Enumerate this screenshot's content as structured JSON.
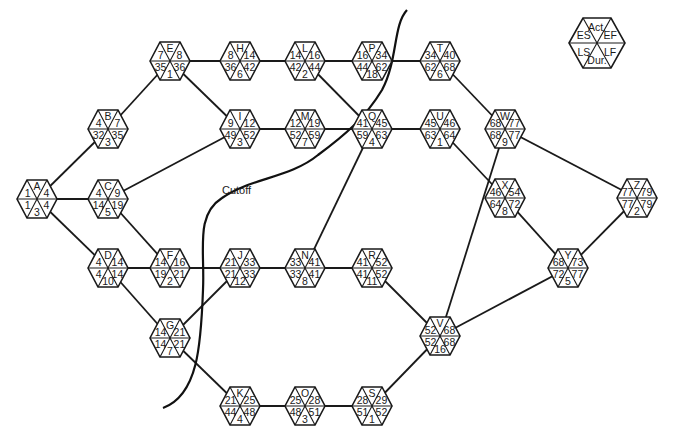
{
  "legend": {
    "center": [
      597,
      43
    ],
    "labels": {
      "act": "Act.",
      "es": "ES",
      "ef": "EF",
      "ls": "LS",
      "lf": "LF",
      "dur": "Dur."
    }
  },
  "cutoff": {
    "label": "Cutoff",
    "label_pos": [
      222,
      192
    ]
  },
  "nodes": [
    {
      "id": "A",
      "x": 37,
      "y": 199,
      "es": 1,
      "ef": 4,
      "ls": 1,
      "lf": 4,
      "dur": 3
    },
    {
      "id": "B",
      "x": 108,
      "y": 129,
      "es": 4,
      "ef": 7,
      "ls": 32,
      "lf": 35,
      "dur": 3
    },
    {
      "id": "C",
      "x": 108,
      "y": 199,
      "es": 4,
      "ef": 9,
      "ls": 14,
      "lf": 19,
      "dur": 5
    },
    {
      "id": "D",
      "x": 108,
      "y": 268,
      "es": 4,
      "ef": 14,
      "ls": 4,
      "lf": 14,
      "dur": 10
    },
    {
      "id": "E",
      "x": 170,
      "y": 61,
      "es": 7,
      "ef": 8,
      "ls": 35,
      "lf": 36,
      "dur": 1
    },
    {
      "id": "F",
      "x": 170,
      "y": 268,
      "es": 14,
      "ef": 16,
      "ls": 19,
      "lf": 21,
      "dur": 2
    },
    {
      "id": "G",
      "x": 170,
      "y": 338,
      "es": 14,
      "ef": 21,
      "ls": 14,
      "lf": 21,
      "dur": 7
    },
    {
      "id": "H",
      "x": 240,
      "y": 61,
      "es": 8,
      "ef": 14,
      "ls": 36,
      "lf": 42,
      "dur": 6
    },
    {
      "id": "I",
      "x": 240,
      "y": 129,
      "es": 9,
      "ef": 12,
      "ls": 49,
      "lf": 52,
      "dur": 3
    },
    {
      "id": "J",
      "x": 240,
      "y": 268,
      "es": 21,
      "ef": 33,
      "ls": 21,
      "lf": 33,
      "dur": 12
    },
    {
      "id": "K",
      "x": 240,
      "y": 406,
      "es": 21,
      "ef": 25,
      "ls": 44,
      "lf": 48,
      "dur": 4
    },
    {
      "id": "L",
      "x": 305,
      "y": 61,
      "es": 14,
      "ef": 16,
      "ls": 42,
      "lf": 44,
      "dur": 2
    },
    {
      "id": "M",
      "x": 305,
      "y": 129,
      "es": 12,
      "ef": 19,
      "ls": 52,
      "lf": 59,
      "dur": 7
    },
    {
      "id": "N",
      "x": 305,
      "y": 268,
      "es": 33,
      "ef": 41,
      "ls": 33,
      "lf": 41,
      "dur": 8
    },
    {
      "id": "O",
      "x": 305,
      "y": 406,
      "es": 25,
      "ef": 28,
      "ls": 48,
      "lf": 51,
      "dur": 3
    },
    {
      "id": "P",
      "x": 372,
      "y": 61,
      "es": 16,
      "ef": 34,
      "ls": 44,
      "lf": 62,
      "dur": 18
    },
    {
      "id": "Q",
      "x": 372,
      "y": 129,
      "es": 41,
      "ef": 45,
      "ls": 59,
      "lf": 63,
      "dur": 4
    },
    {
      "id": "R",
      "x": 372,
      "y": 268,
      "es": 41,
      "ef": 52,
      "ls": 41,
      "lf": 52,
      "dur": 11
    },
    {
      "id": "S",
      "x": 372,
      "y": 406,
      "es": 28,
      "ef": 29,
      "ls": 51,
      "lf": 52,
      "dur": 1
    },
    {
      "id": "T",
      "x": 440,
      "y": 61,
      "es": 34,
      "ef": 40,
      "ls": 62,
      "lf": 68,
      "dur": 6
    },
    {
      "id": "U",
      "x": 440,
      "y": 129,
      "es": 45,
      "ef": 46,
      "ls": 63,
      "lf": 64,
      "dur": 1
    },
    {
      "id": "V",
      "x": 440,
      "y": 336,
      "es": 52,
      "ef": 68,
      "ls": 52,
      "lf": 68,
      "dur": 16
    },
    {
      "id": "W",
      "x": 505,
      "y": 129,
      "es": 68,
      "ef": 77,
      "ls": 68,
      "lf": 77,
      "dur": 9
    },
    {
      "id": "X",
      "x": 505,
      "y": 198,
      "es": 46,
      "ef": 54,
      "ls": 64,
      "lf": 72,
      "dur": 8
    },
    {
      "id": "Y",
      "x": 568,
      "y": 268,
      "es": 68,
      "ef": 73,
      "ls": 72,
      "lf": 77,
      "dur": 5
    },
    {
      "id": "Z",
      "x": 637,
      "y": 198,
      "es": 77,
      "ef": 79,
      "ls": 77,
      "lf": 79,
      "dur": 2
    }
  ],
  "edges": [
    [
      "A",
      "B"
    ],
    [
      "A",
      "C"
    ],
    [
      "A",
      "D"
    ],
    [
      "B",
      "E"
    ],
    [
      "C",
      "I"
    ],
    [
      "C",
      "F"
    ],
    [
      "D",
      "F"
    ],
    [
      "D",
      "G"
    ],
    [
      "E",
      "H"
    ],
    [
      "E",
      "I"
    ],
    [
      "H",
      "L"
    ],
    [
      "I",
      "M"
    ],
    [
      "L",
      "P"
    ],
    [
      "L",
      "Q"
    ],
    [
      "M",
      "Q"
    ],
    [
      "P",
      "T"
    ],
    [
      "Q",
      "U"
    ],
    [
      "F",
      "J"
    ],
    [
      "G",
      "J"
    ],
    [
      "G",
      "K"
    ],
    [
      "J",
      "N"
    ],
    [
      "N",
      "Q"
    ],
    [
      "N",
      "R"
    ],
    [
      "K",
      "O"
    ],
    [
      "O",
      "S"
    ],
    [
      "R",
      "V"
    ],
    [
      "S",
      "V"
    ],
    [
      "T",
      "W"
    ],
    [
      "U",
      "X"
    ],
    [
      "V",
      "W"
    ],
    [
      "V",
      "Y"
    ],
    [
      "W",
      "Z"
    ],
    [
      "X",
      "Y"
    ],
    [
      "Y",
      "Z"
    ]
  ]
}
